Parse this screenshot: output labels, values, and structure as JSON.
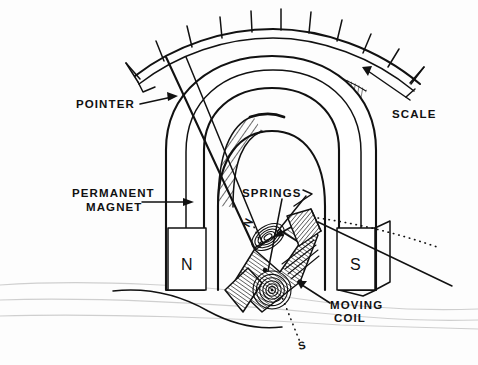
{
  "figure": {
    "background_color": "#fdfdfd",
    "ink_color": "#111111",
    "guide_color": "#cfcfcf"
  },
  "labels": {
    "pointer": "POINTER",
    "scale": "SCALE",
    "permanent_magnet_line1": "PERMANENT",
    "permanent_magnet_line2": "MAGNET",
    "springs": "SPRINGS",
    "moving_coil_line1": "MOVING",
    "moving_coil_line2": "COIL",
    "pole_north": "N",
    "pole_south": "S",
    "coil_axis_north": "N",
    "coil_axis_south": "S"
  },
  "parts": {
    "scale_arc": {
      "name": "scale-arc",
      "tick_count": 11,
      "has_hatched_band": true
    },
    "magnet": {
      "name": "permanent-magnet",
      "shape": "horseshoe",
      "pole_left": "N",
      "pole_right": "S",
      "inner_arch_hatched": true
    },
    "springs": {
      "name": "hairsprings",
      "count": 2,
      "spiral_turns": 6
    },
    "moving_coil": {
      "name": "moving-coil",
      "shape": "rectangular-former",
      "hatched": true
    },
    "pointer": {
      "name": "pointer-needle",
      "orientation": "diagonal"
    }
  }
}
